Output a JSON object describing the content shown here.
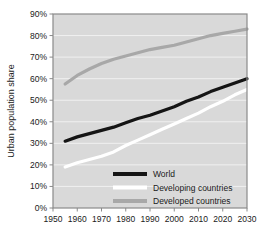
{
  "chart_data": {
    "type": "line",
    "title": "",
    "xlabel": "",
    "ylabel": "Urban population share",
    "xlim": [
      1950,
      2030
    ],
    "ylim": [
      0,
      90
    ],
    "grid": true,
    "legend_position": "inside-bottom-center",
    "x_ticks": [
      "1950",
      "1960",
      "1970",
      "1980",
      "1990",
      "2000",
      "2010",
      "2020",
      "2030"
    ],
    "y_ticks": [
      "0%",
      "10%",
      "20%",
      "30%",
      "40%",
      "50%",
      "60%",
      "70%",
      "80%",
      "90%"
    ],
    "x": [
      1955,
      1960,
      1965,
      1970,
      1975,
      1980,
      1985,
      1990,
      1995,
      2000,
      2005,
      2010,
      2015,
      2020,
      2025,
      2030
    ],
    "series": [
      {
        "name": "World",
        "color": "#151515",
        "values": [
          31,
          33,
          34.5,
          36,
          37.5,
          39.5,
          41.5,
          43,
          45,
          47,
          49.5,
          51.5,
          54,
          56,
          58,
          60
        ]
      },
      {
        "name": "Developing countries",
        "color": "#ffffff",
        "values": [
          19,
          21,
          22.5,
          24,
          26,
          29,
          31.5,
          34,
          36.5,
          39,
          41.5,
          44,
          47,
          49.5,
          52.5,
          55
        ]
      },
      {
        "name": "Developed countries",
        "color": "#a8a8a8",
        "values": [
          57.5,
          61.5,
          64.5,
          67,
          69,
          70.5,
          72,
          73.5,
          74.5,
          75.5,
          77,
          78.5,
          80,
          81,
          82,
          83
        ]
      }
    ]
  },
  "axes": {
    "y_title": "Urban population share"
  },
  "legend": {
    "items": [
      {
        "label": "World",
        "color": "#151515"
      },
      {
        "label": "Developing countries",
        "color": "#ffffff"
      },
      {
        "label": "Developed countries",
        "color": "#a8a8a8"
      }
    ]
  },
  "colors": {
    "plot_background": "#d9d9d9",
    "gridline": "#f0f0f0",
    "axis_line": "#8a8a8a",
    "page_background": "#ffffff",
    "text": "#1a1a1a"
  }
}
